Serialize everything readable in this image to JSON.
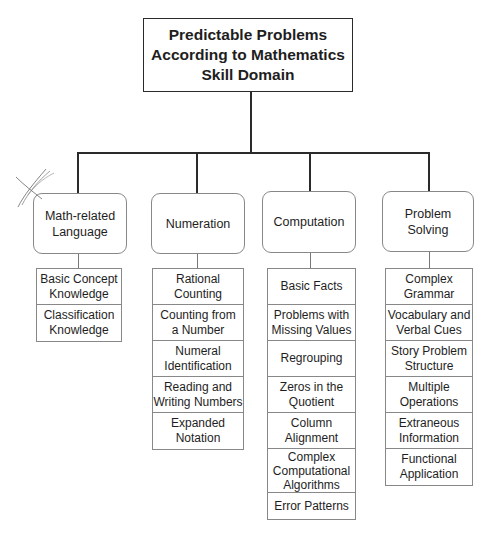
{
  "title": "Predictable Problems\nAccording to Mathematics\nSkill Domain",
  "domains": [
    {
      "label": "Math-related\nLanguage",
      "items": [
        "Basic Concept\nKnowledge",
        "Classification\nKnowledge"
      ]
    },
    {
      "label": "Numeration",
      "items": [
        "Rational\nCounting",
        "Counting from\na Number",
        "Numeral\nIdentification",
        "Reading and\nWriting Numbers",
        "Expanded\nNotation"
      ]
    },
    {
      "label": "Computation",
      "items": [
        "Basic Facts",
        "Problems with\nMissing Values",
        "Regrouping",
        "Zeros in the\nQuotient",
        "Column\nAlignment",
        "Complex\nComputational\nAlgorithms",
        "Error Patterns"
      ]
    },
    {
      "label": "Problem\nSolving",
      "items": [
        "Complex\nGrammar",
        "Vocabulary and\nVerbal Cues",
        "Story Problem\nStructure",
        "Multiple\nOperations",
        "Extraneous\nInformation",
        "Functional\nApplication"
      ]
    }
  ],
  "colors": {
    "line": "#2a2a2a",
    "box_border": "#888888",
    "text": "#1e1e1e"
  }
}
